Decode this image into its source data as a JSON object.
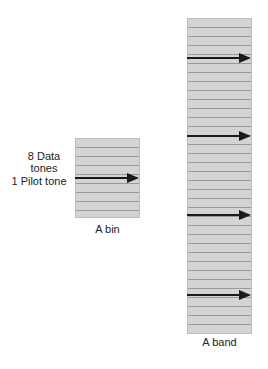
{
  "diagram": {
    "bin": {
      "label": "A bin",
      "side_label_lines": [
        "8 Data",
        "tones",
        "1 Pilot tone"
      ],
      "data_tones": 8,
      "pilot_tones": 1
    },
    "band": {
      "label": "A band",
      "bins": 4,
      "pilot_arrows": 4
    },
    "caption": ""
  },
  "colors": {
    "fill": "#d4d4d4",
    "stripe": "#9a9a9a",
    "arrow": "#1a1a1a"
  }
}
